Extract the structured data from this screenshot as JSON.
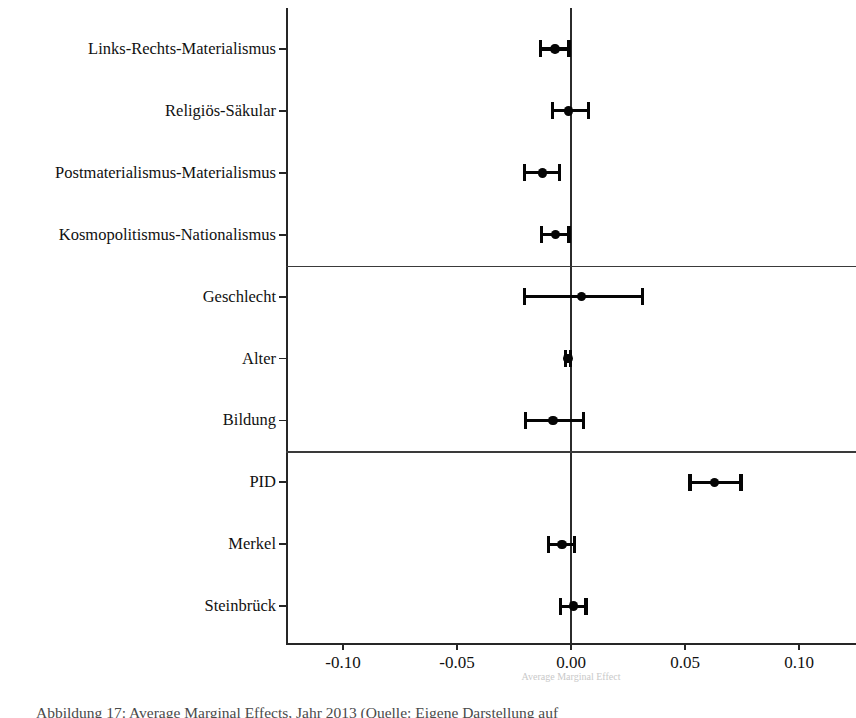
{
  "figure": {
    "caption_label": "Abbildung",
    "caption_text": "Abbildung 17: Average Marginal Effects, Jahr 2013 (Quelle: Eigene Darstellung auf",
    "xaxis_hidden_title": "Average Marginal Effect"
  },
  "chart_data": {
    "type": "scatter",
    "title": "",
    "subtitle": "",
    "xlabel": "",
    "ylabel": "",
    "xlim": [
      -0.125,
      0.125
    ],
    "ylim": [
      0,
      10
    ],
    "grid": false,
    "legend": null,
    "zero_reference_line": 0.0,
    "orientation": "horizontal",
    "error_bars": "confidence interval",
    "xticks": [
      -0.1,
      -0.05,
      0.0,
      0.05,
      0.1
    ],
    "xticklabels": [
      "-0.10",
      "-0.05",
      "0.00",
      "0.05",
      "0.10"
    ],
    "group_separators_after": [
      "Kosmopolitismus-Nationalismus",
      "Bildung"
    ],
    "categories": [
      "Links-Rechts-Materialismus",
      "Religiös-Säkular",
      "Postmaterialismus-Materialismus",
      "Kosmopolitismus-Nationalismus",
      "Geschlecht",
      "Alter",
      "Bildung",
      "PID",
      "Merkel",
      "Steinbrück"
    ],
    "values": [
      -0.0071,
      -0.001,
      -0.0125,
      -0.0069,
      0.0045,
      -0.0013,
      -0.008,
      0.063,
      -0.004,
      0.001
    ],
    "ci_low": [
      -0.0134,
      -0.0081,
      -0.0205,
      -0.0129,
      -0.0205,
      -0.0025,
      -0.0201,
      0.0522,
      -0.0098,
      -0.0045
    ],
    "ci_high": [
      -0.0009,
      0.0076,
      -0.0049,
      -0.0009,
      0.0313,
      -0.0002,
      0.0054,
      0.0746,
      0.0017,
      0.0066
    ],
    "points": [
      {
        "label": "Links-Rechts-Materialismus",
        "estimate": -0.0071,
        "ci_low": -0.0134,
        "ci_high": -0.0009
      },
      {
        "label": "Religiös-Säkular",
        "estimate": -0.001,
        "ci_low": -0.0081,
        "ci_high": 0.0076
      },
      {
        "label": "Postmaterialismus-Materialismus",
        "estimate": -0.0125,
        "ci_low": -0.0205,
        "ci_high": -0.0049
      },
      {
        "label": "Kosmopolitismus-Nationalismus",
        "estimate": -0.0069,
        "ci_low": -0.0129,
        "ci_high": -0.0009
      },
      {
        "label": "Geschlecht",
        "estimate": 0.0045,
        "ci_low": -0.0205,
        "ci_high": 0.0313
      },
      {
        "label": "Alter",
        "estimate": -0.0013,
        "ci_low": -0.0025,
        "ci_high": -0.0002
      },
      {
        "label": "Bildung",
        "estimate": -0.008,
        "ci_low": -0.0201,
        "ci_high": 0.0054
      },
      {
        "label": "PID",
        "estimate": 0.063,
        "ci_low": 0.0522,
        "ci_high": 0.0746
      },
      {
        "label": "Merkel",
        "estimate": -0.004,
        "ci_low": -0.0098,
        "ci_high": 0.0017
      },
      {
        "label": "Steinbrück",
        "estimate": 0.001,
        "ci_low": -0.0045,
        "ci_high": 0.0066
      }
    ]
  }
}
